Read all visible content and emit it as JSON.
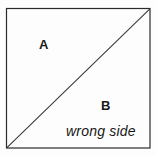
{
  "figure": {
    "type": "geometry-diagram",
    "background_color": "#fdfdfd",
    "line_color": "#2b2b2b",
    "text_color": "#1a1a1a",
    "square": {
      "left": 6,
      "top": 8,
      "right": 150,
      "bottom": 148,
      "stroke_width": 1.2
    },
    "diagonal": {
      "from_corner": "top-right",
      "to_corner": "bottom-left",
      "x1": 150,
      "y1": 9,
      "x2": 7,
      "y2": 147,
      "stroke_width": 1.1
    },
    "labels": [
      {
        "id": "a",
        "text": "A",
        "region": "upper-left-triangle"
      },
      {
        "id": "b",
        "text": "B",
        "region": "lower-right-triangle"
      },
      {
        "id": "wrong_side",
        "text": "wrong side",
        "region": "lower-right-triangle",
        "style": "italic"
      }
    ],
    "label_a": "A",
    "label_b": "B",
    "label_wrong_side": "wrong side"
  }
}
